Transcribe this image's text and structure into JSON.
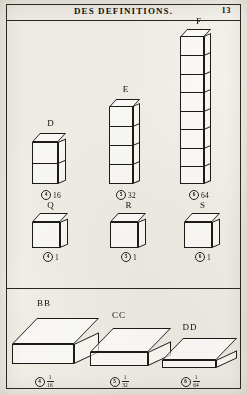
{
  "page": {
    "header_title": "DES DEFINITIONS.",
    "folio": "13"
  },
  "figures": [
    {
      "letter": "D",
      "ref": "4",
      "value": "16",
      "value_kind": "integer",
      "shape": "column",
      "segments": 2
    },
    {
      "letter": "E",
      "ref": "5",
      "value": "32",
      "value_kind": "integer",
      "shape": "column",
      "segments": 4
    },
    {
      "letter": "F",
      "ref": "6",
      "value": "64",
      "value_kind": "integer",
      "shape": "column",
      "segments": 8
    },
    {
      "letter": "Q",
      "ref": "4",
      "value": "1",
      "value_kind": "integer",
      "shape": "cube",
      "segments": 1
    },
    {
      "letter": "R",
      "ref": "5",
      "value": "1",
      "value_kind": "integer",
      "shape": "cube",
      "segments": 1
    },
    {
      "letter": "S",
      "ref": "6",
      "value": "1",
      "value_kind": "integer",
      "shape": "cube",
      "segments": 1
    },
    {
      "letter": "BB",
      "ref": "4",
      "value_kind": "fraction",
      "numerator": "1",
      "denominator": "16",
      "shape": "slab"
    },
    {
      "letter": "CC",
      "ref": "5",
      "value_kind": "fraction",
      "numerator": "1",
      "denominator": "32",
      "shape": "slab"
    },
    {
      "letter": "DD",
      "ref": "6",
      "value_kind": "fraction",
      "numerator": "1",
      "denominator": "64",
      "shape": "slab"
    }
  ]
}
